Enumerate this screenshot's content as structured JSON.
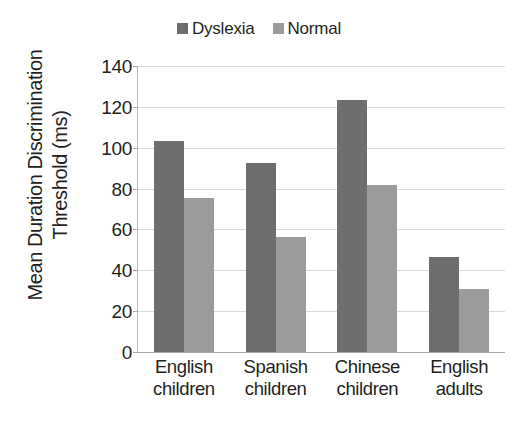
{
  "chart_data": {
    "type": "bar",
    "title": "",
    "xlabel": "",
    "ylabel_line1": "Mean Duration Discrimination",
    "ylabel_line2": "Threshold (ms)",
    "ylabel": "Mean Duration Discrimination Threshold (ms)",
    "ylim": [
      0,
      140
    ],
    "ytick_values": [
      140,
      120,
      100,
      80,
      60,
      40,
      20,
      0
    ],
    "ytick_labels": [
      "140",
      "120",
      "100",
      "80",
      "60",
      "40",
      "20",
      "0"
    ],
    "grid": true,
    "legend_position": "top-center",
    "categories": [
      "English children",
      "Spanish children",
      "Chinese children",
      "English adults"
    ],
    "category_lines": [
      {
        "line1": "English",
        "line2": "children"
      },
      {
        "line1": "Spanish",
        "line2": "children"
      },
      {
        "line1": "Chinese",
        "line2": "children"
      },
      {
        "line1": "English",
        "line2": "adults"
      }
    ],
    "series": [
      {
        "name": "Dyslexia",
        "color": "#6e6e6e",
        "values": [
          103.5,
          92.5,
          123.5,
          46.5
        ]
      },
      {
        "name": "Normal",
        "color": "#9b9b9b",
        "values": [
          75.5,
          56.5,
          82.0,
          31.0
        ]
      }
    ]
  },
  "legend": {
    "items": [
      {
        "label": "Dyslexia",
        "color": "#6e6e6e"
      },
      {
        "label": "Normal",
        "color": "#9b9b9b"
      }
    ]
  },
  "colors": {
    "dyslexia": "#6e6e6e",
    "normal": "#9b9b9b",
    "gridline": "#d9d9d9",
    "axis": "#a6a6a6",
    "text": "#231f20",
    "background": "#ffffff"
  }
}
